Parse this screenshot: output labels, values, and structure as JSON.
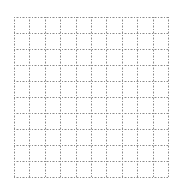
{
  "grid": {
    "left": 14,
    "top": 17,
    "right": 168,
    "bottom": 177,
    "columns": 10,
    "rows": 10,
    "line_color": "#8a8a8a",
    "line_color_light": "#c8c8c8",
    "background": "#ffffff",
    "dash": "1,2",
    "line_style": "dotted"
  }
}
